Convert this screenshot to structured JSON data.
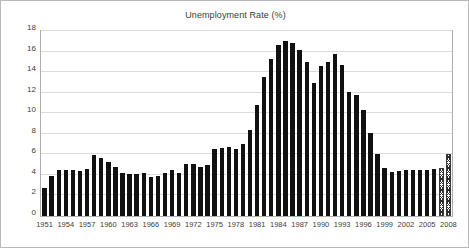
{
  "chart_data": {
    "type": "bar",
    "title": "Unemployment Rate (%)",
    "xlabel": "",
    "ylabel": "",
    "ylim": [
      0,
      18
    ],
    "ytick_step": 2,
    "yticks": [
      0,
      2,
      4,
      6,
      8,
      10,
      12,
      14,
      16,
      18
    ],
    "grid": true,
    "legend": null,
    "bar_color": "#111111",
    "forecast_bar_style": "hatched",
    "x": [
      1951,
      1952,
      1953,
      1954,
      1955,
      1956,
      1957,
      1958,
      1959,
      1960,
      1961,
      1962,
      1963,
      1964,
      1965,
      1966,
      1967,
      1968,
      1969,
      1970,
      1971,
      1972,
      1973,
      1974,
      1975,
      1976,
      1977,
      1978,
      1979,
      1980,
      1981,
      1982,
      1983,
      1984,
      1985,
      1986,
      1987,
      1988,
      1989,
      1990,
      1991,
      1992,
      1993,
      1994,
      1995,
      1996,
      1997,
      1998,
      1999,
      2000,
      2001,
      2002,
      2003,
      2004,
      2005,
      2006,
      2007,
      2008
    ],
    "values": [
      2.7,
      3.9,
      4.5,
      4.5,
      4.5,
      4.4,
      4.6,
      5.9,
      5.6,
      5.3,
      4.8,
      4.2,
      4.1,
      4.1,
      4.2,
      3.8,
      3.9,
      4.2,
      4.5,
      4.2,
      5.1,
      5.1,
      4.8,
      5.0,
      6.5,
      6.6,
      6.7,
      6.5,
      7.0,
      8.4,
      10.8,
      13.5,
      15.3,
      16.6,
      17.0,
      16.8,
      16.2,
      15.0,
      12.9,
      14.6,
      15.0,
      15.8,
      14.7,
      12.1,
      11.8,
      10.3,
      8.1,
      6.0,
      4.7,
      4.3,
      4.4,
      4.5,
      4.5,
      4.5,
      4.5,
      4.6,
      4.7,
      6.0
    ],
    "xtick_labels": [
      "1951",
      "1954",
      "1957",
      "1960",
      "1963",
      "1966",
      "1969",
      "1972",
      "1975",
      "1978",
      "1981",
      "1984",
      "1987",
      "1990",
      "1993",
      "1996",
      "1999",
      "2002",
      "2005",
      "2008"
    ],
    "xtick_years": [
      1951,
      1954,
      1957,
      1960,
      1963,
      1966,
      1969,
      1972,
      1975,
      1978,
      1981,
      1984,
      1987,
      1990,
      1993,
      1996,
      1999,
      2002,
      2005,
      2008
    ],
    "forecast_years": [
      2007,
      2008
    ]
  }
}
